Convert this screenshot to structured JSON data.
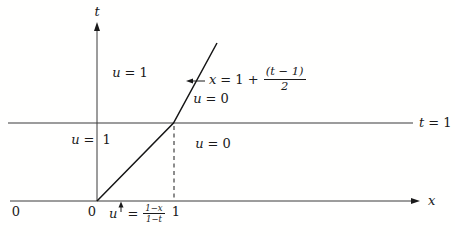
{
  "colors": {
    "ink": "#1a1a1a",
    "line": "#3a3a3a",
    "background": "#fffffe"
  },
  "labels": {
    "t_axis": "t",
    "x_axis": "x",
    "t_equals_1": {
      "var": "t",
      "rest": "= 1"
    },
    "region_upper_left": {
      "var": "u",
      "rest": "= 1"
    },
    "region_upper_right": {
      "var": "u",
      "rest": "= 0"
    },
    "region_lower_left": {
      "var": "u",
      "rest": "= 1"
    },
    "region_lower_right": {
      "var": "u",
      "rest": "= 0"
    },
    "shock_equation": {
      "var": "x",
      "rest": "= 1 +",
      "numerator": "(t − 1)",
      "denominator": "2"
    },
    "fan_equation": {
      "var": "u",
      "rest": "=",
      "numerator": "1−x",
      "denominator": "1−t"
    },
    "tick_left_zero": "0",
    "tick_origin_zero": "0",
    "tick_one": "1"
  }
}
